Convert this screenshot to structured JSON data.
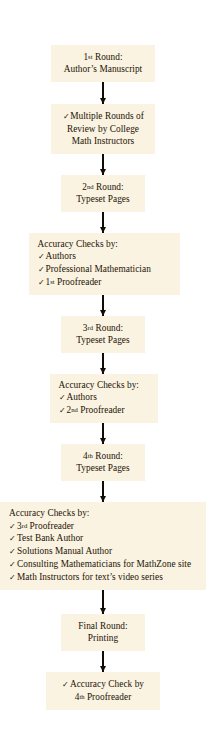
{
  "diagram": {
    "box_fill": "#faf3e1",
    "page_background": "#ffffff",
    "text_color": "#1d1206",
    "arrow_color": "#120c04",
    "check_glyph": "✓"
  },
  "nodes": [
    {
      "id": "round-1",
      "type": "round",
      "lines": [
        {
          "pre": "1",
          "ord": "st",
          "post": " Round:"
        },
        {
          "text": "Author’s Manuscript"
        }
      ]
    },
    {
      "id": "review-college-math-instructors",
      "type": "checklist",
      "items": [
        {
          "text": "Multiple Rounds of"
        },
        {
          "text": "Review by College",
          "nocheck": true
        },
        {
          "text": "Math Instructors",
          "nocheck": true
        }
      ]
    },
    {
      "id": "round-2",
      "type": "round",
      "lines": [
        {
          "pre": "2",
          "ord": "nd",
          "post": " Round:"
        },
        {
          "text": "Typeset Pages"
        }
      ]
    },
    {
      "id": "accuracy-checks-1",
      "type": "checklist",
      "heading": "Accuracy Checks by:",
      "items": [
        {
          "text": "Authors"
        },
        {
          "text": "Professional Mathematician"
        },
        {
          "pre": "1",
          "ord": "st",
          "post": " Proofreader"
        }
      ]
    },
    {
      "id": "round-3",
      "type": "round",
      "lines": [
        {
          "pre": "3",
          "ord": "rd",
          "post": " Round:"
        },
        {
          "text": "Typeset Pages"
        }
      ]
    },
    {
      "id": "accuracy-checks-2",
      "type": "checklist",
      "heading": "Accuracy Checks by:",
      "items": [
        {
          "text": "Authors"
        },
        {
          "pre": "2",
          "ord": "nd",
          "post": " Proofreader"
        }
      ]
    },
    {
      "id": "round-4",
      "type": "round",
      "lines": [
        {
          "pre": "4",
          "ord": "th",
          "post": " Round:"
        },
        {
          "text": "Typeset Pages"
        }
      ]
    },
    {
      "id": "accuracy-checks-3",
      "type": "checklist",
      "heading": "Accuracy Checks by:",
      "items": [
        {
          "pre": "3",
          "ord": "rd",
          "post": " Proofreader"
        },
        {
          "text": "Test Bank Author"
        },
        {
          "text": "Solutions Manual Author"
        },
        {
          "text": "Consulting Mathematicians for MathZone site"
        },
        {
          "text": "Math Instructors for text’s video series"
        }
      ]
    },
    {
      "id": "final-round",
      "type": "round",
      "lines": [
        {
          "text": "Final Round:"
        },
        {
          "text": "Printing"
        }
      ]
    },
    {
      "id": "accuracy-check-final",
      "type": "checklist-centered",
      "items": [
        {
          "text": "Accuracy Check by"
        },
        {
          "pre": "4",
          "ord": "th",
          "post": " Proofreader",
          "nocheck": true
        }
      ]
    }
  ],
  "text": {
    "n1_l1_pre": "1",
    "n1_l1_ord": "st",
    "n1_l1_post": " Round:",
    "n1_l2": "Author’s Manuscript",
    "n2_l1": "Multiple Rounds of",
    "n2_l2": "Review by College",
    "n2_l3": "Math Instructors",
    "n3_l1_pre": "2",
    "n3_l1_ord": "nd",
    "n3_l1_post": " Round:",
    "n3_l2": "Typeset Pages",
    "n4_head": "Accuracy Checks by:",
    "n4_i1": "Authors",
    "n4_i2": "Professional Mathematician",
    "n4_i3_pre": "1",
    "n4_i3_ord": "st",
    "n4_i3_post": " Proofreader",
    "n5_l1_pre": "3",
    "n5_l1_ord": "rd",
    "n5_l1_post": " Round:",
    "n5_l2": "Typeset Pages",
    "n6_head": "Accuracy Checks by:",
    "n6_i1": "Authors",
    "n6_i2_pre": "2",
    "n6_i2_ord": "nd",
    "n6_i2_post": " Proofreader",
    "n7_l1_pre": "4",
    "n7_l1_ord": "th",
    "n7_l1_post": " Round:",
    "n7_l2": "Typeset Pages",
    "n8_head": "Accuracy Checks by:",
    "n8_i1_pre": "3",
    "n8_i1_ord": "rd",
    "n8_i1_post": " Proofreader",
    "n8_i2": "Test Bank Author",
    "n8_i3": "Solutions Manual Author",
    "n8_i4": "Consulting Mathematicians for MathZone site",
    "n8_i5": "Math Instructors for text’s video series",
    "n9_l1": "Final Round:",
    "n9_l2": "Printing",
    "n10_l1": "Accuracy Check by",
    "n10_l2_pre": "4",
    "n10_l2_ord": "th",
    "n10_l2_post": " Proofreader",
    "check": "✓"
  }
}
